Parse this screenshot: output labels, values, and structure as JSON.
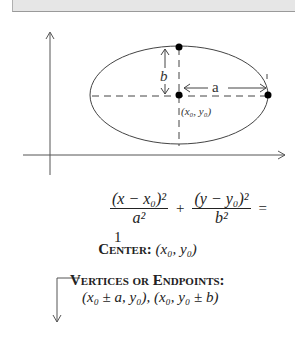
{
  "diagram": {
    "labels": {
      "semi_minor": "b",
      "semi_major": "a",
      "center_point": "(x₀, y₀)"
    },
    "colors": {
      "stroke": "#333333",
      "dash": "#444444",
      "point": "#000000",
      "topbar": "#e6e6e6"
    }
  },
  "equation": {
    "term1_numerator": "(x − x₀)²",
    "term1_denominator": "a²",
    "plus": "+",
    "term2_numerator": "(y − y₀)²",
    "term2_denominator": "b²",
    "equals": "=",
    "rhs": "1"
  },
  "center": {
    "label": "Center:",
    "value": "(x₀, y₀)"
  },
  "vertices": {
    "label": "Vertices or Endpoints:",
    "value": "(x₀ ± a, y₀), (x₀, y₀ ± b)"
  }
}
